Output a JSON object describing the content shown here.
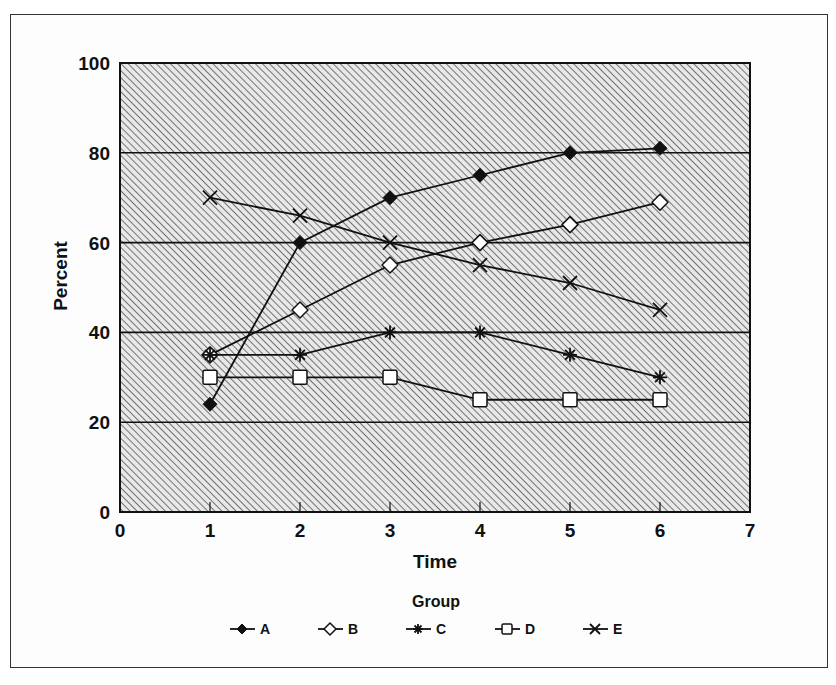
{
  "chart_data": {
    "type": "line",
    "title": "",
    "xlabel": "Time",
    "ylabel": "Percent",
    "xlim": [
      0,
      7
    ],
    "ylim": [
      0,
      100
    ],
    "x_ticks": [
      "0",
      "1",
      "2",
      "3",
      "4",
      "5",
      "6",
      "7"
    ],
    "y_ticks": [
      "0",
      "20",
      "40",
      "60",
      "80",
      "100"
    ],
    "grid": "horizontal at 20, 40, 60, 80",
    "background": "diagonal hatch pattern",
    "legend_title": "Group",
    "legend_position": "bottom",
    "x": [
      1,
      2,
      3,
      4,
      5,
      6
    ],
    "series": [
      {
        "name": "A",
        "marker": "filled-diamond",
        "values": [
          24,
          60,
          70,
          75,
          80,
          81
        ]
      },
      {
        "name": "B",
        "marker": "open-diamond",
        "values": [
          35,
          45,
          55,
          60,
          64,
          69
        ]
      },
      {
        "name": "C",
        "marker": "asterisk",
        "values": [
          35,
          35,
          40,
          40,
          35,
          30
        ]
      },
      {
        "name": "D",
        "marker": "open-square",
        "values": [
          30,
          30,
          30,
          25,
          25,
          25
        ]
      },
      {
        "name": "E",
        "marker": "x-cross",
        "values": [
          70,
          66,
          60,
          55,
          51,
          45
        ]
      }
    ]
  },
  "labels": {
    "x_axis": "Time",
    "y_axis": "Percent",
    "legend_title": "Group",
    "legend": [
      "A",
      "B",
      "C",
      "D",
      "E"
    ],
    "x_ticks": [
      "0",
      "1",
      "2",
      "3",
      "4",
      "5",
      "6",
      "7"
    ],
    "y_ticks": [
      "0",
      "20",
      "40",
      "60",
      "80",
      "100"
    ]
  }
}
